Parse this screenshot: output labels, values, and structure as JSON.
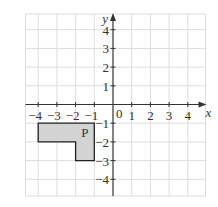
{
  "diagram": {
    "type": "coordinate-grid",
    "x_axis": {
      "label": "x",
      "min": -5,
      "max": 5,
      "tick_labels": [
        "-4",
        "-3",
        "-2",
        "-1",
        "1",
        "2",
        "3",
        "4"
      ]
    },
    "y_axis": {
      "label": "y",
      "min": -5,
      "max": 5,
      "tick_labels": [
        "4",
        "3",
        "2",
        "1",
        "-1",
        "-2",
        "-3",
        "-4"
      ]
    },
    "origin_label": "0",
    "shapes": [
      {
        "name": "P",
        "label": "P",
        "vertices": [
          [
            -4,
            -1
          ],
          [
            -1,
            -1
          ],
          [
            -1,
            -3
          ],
          [
            -2,
            -3
          ],
          [
            -2,
            -2
          ],
          [
            -4,
            -2
          ]
        ],
        "label_position": [
          -1.5,
          -1.5
        ],
        "fill": "#d3d3d3",
        "stroke": "#222222"
      }
    ]
  },
  "colors": {
    "grid": "#dcdcdc",
    "axis": "#333333",
    "background": "#ffffff"
  }
}
